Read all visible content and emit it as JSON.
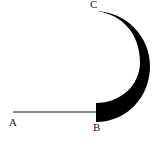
{
  "diagram": {
    "type": "geometric-figure",
    "colors": {
      "stroke": "#111111",
      "fill": "#000000",
      "background": "#ffffff",
      "label": "#222222"
    },
    "points": [
      {
        "id": "A",
        "label": "A"
      },
      {
        "id": "B",
        "label": "B"
      },
      {
        "id": "C",
        "label": "C"
      }
    ],
    "segments": [
      {
        "from": "A",
        "to": "B",
        "style": "thin-line"
      }
    ],
    "arcs": [
      {
        "from": "B",
        "to": "C",
        "style": "filled-crescent",
        "thick_end": "B",
        "thin_end": "C"
      }
    ]
  }
}
